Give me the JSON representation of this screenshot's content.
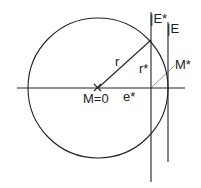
{
  "diagram": {
    "labels": {
      "r": "r",
      "r_star": "r*",
      "m_star": "M*",
      "m_zero": "M=0",
      "e_star": "e*",
      "E_star": "|E*",
      "E": "|E"
    },
    "colors": {
      "stroke": "#222222",
      "background": "#ffffff"
    }
  }
}
